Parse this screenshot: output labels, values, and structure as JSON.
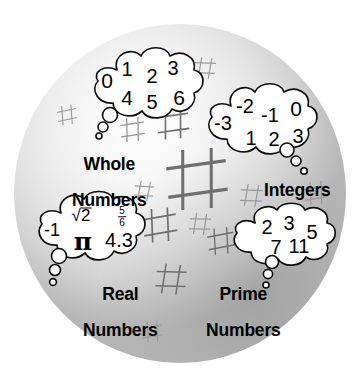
{
  "figure": {
    "background_color": "#ffffff",
    "sphere_color_light": "#fdfdfd",
    "sphere_color_dark": "#b6b6b6",
    "ink_color": "#000000",
    "hash_stroke_color": "#9a9a9a"
  },
  "groups": [
    {
      "id": "whole-numbers",
      "label": "Whole\nNumbers",
      "label_line1": "Whole",
      "label_line2": "Numbers",
      "members": [
        "0",
        "1",
        "2",
        "3",
        "4",
        "5",
        "6"
      ]
    },
    {
      "id": "integers",
      "label": "Integers",
      "label_line1": "Integers",
      "label_line2": "",
      "members": [
        "-3",
        "-2",
        "-1",
        "0",
        "1",
        "2",
        "3"
      ]
    },
    {
      "id": "real-numbers",
      "label": "Real\nNumbers",
      "label_line1": "Real",
      "label_line2": "Numbers",
      "members": [
        "-1",
        "√2",
        "5/6",
        "π",
        "4.3"
      ]
    },
    {
      "id": "prime-numbers",
      "label": "Prime\nNumbers",
      "label_line1": "Prime",
      "label_line2": "Numbers",
      "members": [
        "2",
        "3",
        "5",
        "7",
        "11"
      ]
    }
  ],
  "whole": {
    "n0": "0",
    "n1": "1",
    "n2": "2",
    "n3": "3",
    "n4": "4",
    "n5": "5",
    "n6": "6"
  },
  "integers": {
    "m3": "-3",
    "m2": "-2",
    "m1": "-1",
    "z0": "0",
    "p1": "1",
    "p2": "2",
    "p3": "3"
  },
  "real": {
    "neg1": "-1",
    "radicand": "2",
    "frac_num": "5",
    "frac_den": "6",
    "pi": "π",
    "dec": "4.3"
  },
  "prime": {
    "p2": "2",
    "p3": "3",
    "p5": "5",
    "p7": "7",
    "p11": "11"
  },
  "labels": {
    "whole_1": "Whole",
    "whole_2": "Numbers",
    "integers_1": "Integers",
    "real_1": "Real",
    "real_2": "Numbers",
    "prime_1": "Prime",
    "prime_2": "Numbers"
  },
  "decor": {
    "hash_glyph": "#",
    "hash_count": 13
  }
}
